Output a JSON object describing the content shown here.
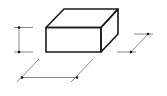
{
  "diagram": {
    "title": "",
    "dimensions": [
      {
        "name": "height",
        "label": ""
      },
      {
        "name": "width",
        "label": ""
      },
      {
        "name": "depth",
        "label": ""
      }
    ],
    "colors": {
      "box_stroke": "#1a1a1a",
      "dimension_stroke": "#6a6a6a",
      "marker": "#111111"
    }
  }
}
